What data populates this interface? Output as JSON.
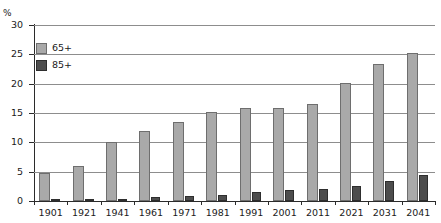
{
  "chart_data": {
    "type": "bar",
    "title": "",
    "xlabel": "",
    "ylabel": "%",
    "ylim": [
      0,
      30
    ],
    "yticks": [
      0,
      5,
      10,
      15,
      20,
      25,
      30
    ],
    "grid": true,
    "legend_position": "top-left",
    "categories": [
      "1901",
      "1921",
      "1941",
      "1961",
      "1971",
      "1981",
      "1991",
      "2001",
      "2011",
      "2021",
      "2031",
      "2041"
    ],
    "series": [
      {
        "name": "65+",
        "color": "#a9a9a9",
        "values": [
          4.7,
          6.0,
          10.0,
          11.9,
          13.4,
          15.1,
          15.9,
          15.9,
          16.6,
          20.1,
          23.3,
          25.3
        ]
      },
      {
        "name": "85+",
        "color": "#4d4d4d",
        "values": [
          0.1,
          0.15,
          0.3,
          0.6,
          0.9,
          1.0,
          1.5,
          1.8,
          2.0,
          2.6,
          3.4,
          4.5
        ]
      }
    ]
  },
  "axis": {
    "y_unit_label": "%"
  }
}
